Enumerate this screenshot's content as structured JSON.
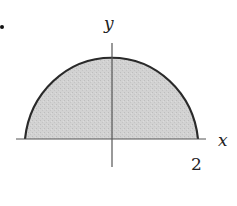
{
  "diagram": {
    "shape": "semicircle",
    "radius": 2,
    "fill_color": "#cfcfcf",
    "stroke_color": "#2a2a2a",
    "axis_color": "#444444",
    "labels": {
      "y_axis": "y",
      "x_axis": "x",
      "tick_right": "2"
    },
    "marker": "•"
  }
}
